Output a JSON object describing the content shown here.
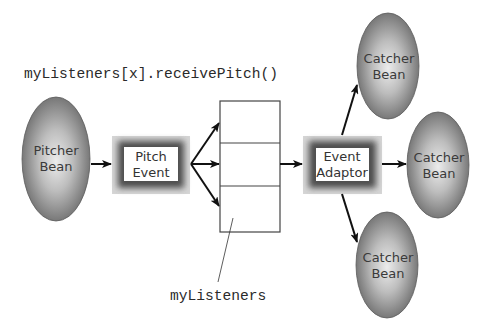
{
  "diagram": {
    "code_caption": "myListeners[x].receivePitch()",
    "array_label": "myListeners",
    "pitcher": {
      "line1": "Pitcher",
      "line2": "Bean"
    },
    "pitch_event": {
      "line1": "Pitch",
      "line2": "Event"
    },
    "event_adaptor": {
      "line1": "Event",
      "line2": "Adaptor"
    },
    "catchers": [
      {
        "line1": "Catcher",
        "line2": "Bean"
      },
      {
        "line1": "Catcher",
        "line2": "Bean"
      },
      {
        "line1": "Catcher",
        "line2": "Bean"
      }
    ],
    "listener_slots": 3,
    "colors": {
      "bean_center": "#e4e4e4",
      "bean_edge": "#6e6e6e",
      "frame_dark": "#5a5a5a",
      "frame_light": "#cfcfcf",
      "arrow": "#111111",
      "box_stroke": "#444444"
    }
  }
}
